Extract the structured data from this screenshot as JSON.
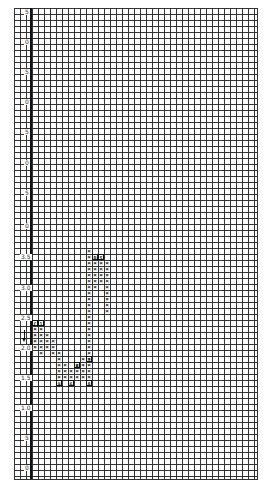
{
  "chart_data": {
    "type": "point-and-figure",
    "title": "",
    "xlabel": "",
    "ylabel": "Price",
    "grid": true,
    "box_size": 0.1,
    "y_tick_labels": [
      {
        "text": "5",
        "y": 12
      },
      {
        "text": "0",
        "y": 42
      },
      {
        "text": "5",
        "y": 72
      },
      {
        "text": "0",
        "y": 102
      },
      {
        "text": "5",
        "y": 132
      },
      {
        "text": "0",
        "y": 163
      },
      {
        "text": "5",
        "y": 193
      },
      {
        "text": "0",
        "y": 226
      },
      {
        "text": "3.5",
        "y": 257
      },
      {
        "text": "3.0",
        "y": 288
      },
      {
        "text": "2.5",
        "y": 318
      },
      {
        "text": "2.0",
        "y": 348
      },
      {
        "text": "1.5",
        "y": 378
      },
      {
        "text": "1.0",
        "y": 408
      },
      {
        "text": "5",
        "y": 438
      },
      {
        "text": "0",
        "y": 468
      }
    ],
    "columns": [
      {
        "col": 3,
        "type": "X",
        "rows": [
          53,
          54,
          55,
          56
        ]
      },
      {
        "col": 4,
        "type": "X",
        "rows": [
          53,
          54,
          55,
          56,
          57
        ]
      },
      {
        "col": 5,
        "type": "X",
        "rows": [
          54,
          55,
          56
        ]
      },
      {
        "col": 6,
        "type": "X",
        "rows": [
          55,
          56,
          57
        ]
      },
      {
        "col": 7,
        "type": "X",
        "rows": [
          57,
          58,
          59,
          60,
          61
        ]
      },
      {
        "col": 8,
        "type": "X",
        "rows": [
          59,
          60,
          61
        ]
      },
      {
        "col": 9,
        "type": "X",
        "rows": [
          60,
          61
        ]
      },
      {
        "col": 10,
        "type": "X",
        "rows": [
          59,
          60,
          61
        ]
      },
      {
        "col": 11,
        "type": "X",
        "rows": [
          58,
          59,
          60,
          61
        ]
      },
      {
        "col": 12,
        "type": "X",
        "rows": [
          40,
          41,
          42,
          43,
          44,
          45,
          46,
          47,
          48,
          49,
          50,
          51,
          52,
          53,
          54,
          55,
          56,
          57,
          58,
          59,
          60,
          61
        ]
      },
      {
        "col": 13,
        "type": "X",
        "rows": [
          42,
          43,
          44,
          45,
          46
        ]
      },
      {
        "col": 14,
        "type": "X",
        "rows": [
          42,
          43,
          44,
          45
        ]
      },
      {
        "col": 15,
        "type": "X",
        "rows": [
          42,
          43,
          44,
          45,
          46,
          47,
          48,
          49,
          50
        ]
      }
    ],
    "month_markers": [
      {
        "col": 3,
        "row": 52,
        "text": "C"
      },
      {
        "col": 4,
        "row": 52,
        "text": "1"
      },
      {
        "col": 13,
        "row": 41,
        "text": "B"
      },
      {
        "col": 14,
        "row": 41,
        "text": "5"
      },
      {
        "col": 12,
        "row": 58,
        "text": "2"
      },
      {
        "col": 10,
        "row": 59,
        "text": "A"
      },
      {
        "col": 7,
        "row": 62,
        "text": "9"
      },
      {
        "col": 9,
        "row": 62,
        "text": "6"
      },
      {
        "col": 12,
        "row": 62,
        "text": "8"
      }
    ]
  }
}
